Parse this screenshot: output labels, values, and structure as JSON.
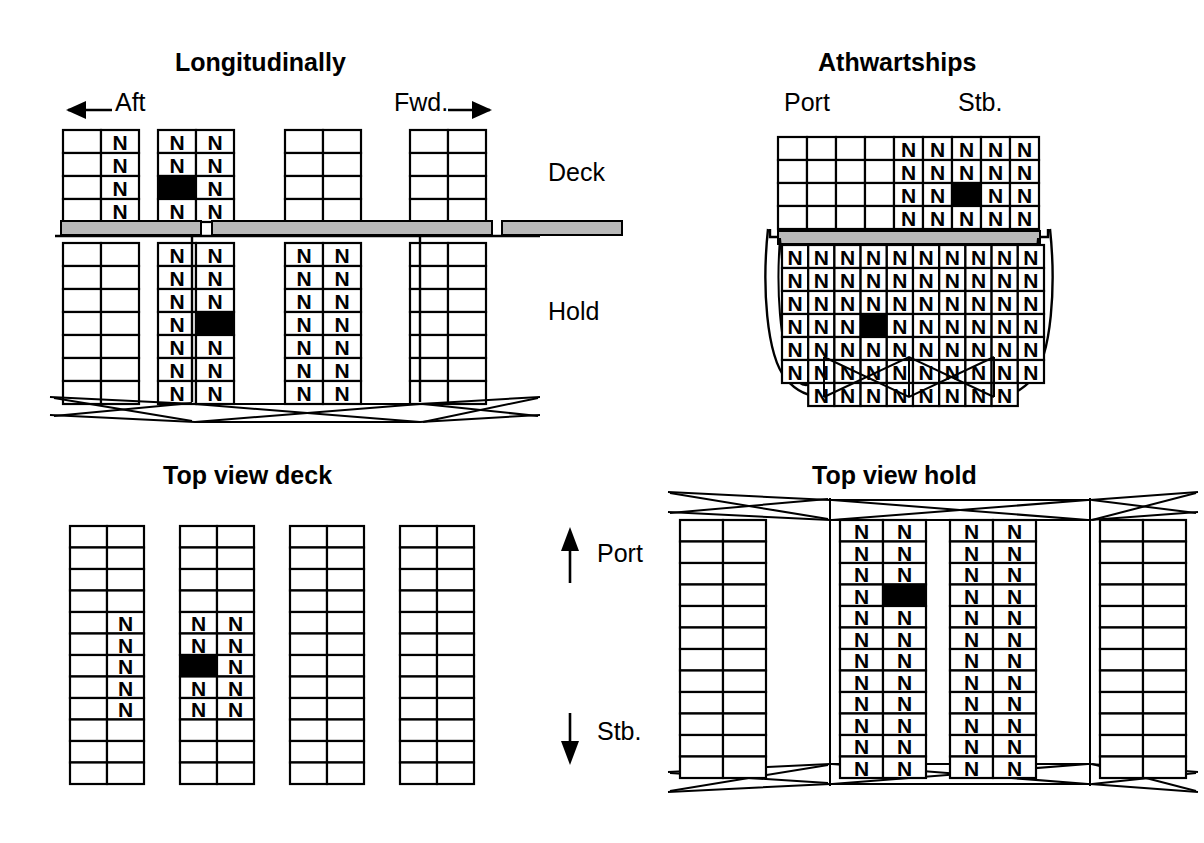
{
  "figure": {
    "container_symbol": "N",
    "colors": {
      "line": "#000000",
      "filled_cell": "#000000",
      "hatch_cover": "#b9b9b9",
      "background": "#ffffff"
    }
  },
  "panels": {
    "longitudinal": {
      "title": "Longitudinally",
      "direction_left_label": "Aft",
      "direction_right_label": "Fwd.",
      "row_label_deck": "Deck",
      "row_label_hold": "Hold",
      "deck": {
        "bays": 4,
        "rows": 4,
        "cols": 2,
        "grid": [
          [
            [
              "",
              "N"
            ],
            [
              "",
              "N"
            ],
            [
              "",
              "N"
            ],
            [
              "",
              "N"
            ]
          ],
          [
            [
              "N",
              "N"
            ],
            [
              "N",
              "N"
            ],
            [
              "X",
              "N"
            ],
            [
              "N",
              "N"
            ]
          ],
          [
            [
              "",
              ""
            ],
            [
              "",
              ""
            ],
            [
              "",
              ""
            ],
            [
              "",
              ""
            ]
          ],
          [
            [
              "",
              ""
            ],
            [
              "",
              ""
            ],
            [
              "",
              ""
            ],
            [
              "",
              ""
            ]
          ]
        ]
      },
      "hold": {
        "bays": 4,
        "rows": 7,
        "cols": 2,
        "grid": [
          [
            [
              "",
              ""
            ],
            [
              "",
              ""
            ],
            [
              "",
              ""
            ],
            [
              "",
              ""
            ],
            [
              "",
              ""
            ],
            [
              "",
              ""
            ],
            [
              "",
              ""
            ]
          ],
          [
            [
              "N",
              "N"
            ],
            [
              "N",
              "N"
            ],
            [
              "N",
              "N"
            ],
            [
              "N",
              "X"
            ],
            [
              "N",
              "N"
            ],
            [
              "N",
              "N"
            ],
            [
              "N",
              "N"
            ]
          ],
          [
            [
              "N",
              "N"
            ],
            [
              "N",
              "N"
            ],
            [
              "N",
              "N"
            ],
            [
              "N",
              "N"
            ],
            [
              "N",
              "N"
            ],
            [
              "N",
              "N"
            ],
            [
              "N",
              "N"
            ]
          ],
          [
            [
              "",
              ""
            ],
            [
              "",
              ""
            ],
            [
              "",
              ""
            ],
            [
              "",
              ""
            ],
            [
              "",
              ""
            ],
            [
              "",
              ""
            ],
            [
              "",
              ""
            ]
          ]
        ]
      }
    },
    "athwartships": {
      "title": "Athwartships",
      "port_label": "Port",
      "stb_label": "Stb.",
      "deck": {
        "rows": 4,
        "cols": 9,
        "grid": [
          [
            "",
            "",
            "",
            "",
            "N",
            "N",
            "N",
            "N",
            "N"
          ],
          [
            "",
            "",
            "",
            "",
            "N",
            "N",
            "N",
            "N",
            "N"
          ],
          [
            "",
            "",
            "",
            "",
            "N",
            "N",
            "X",
            "N",
            "N"
          ],
          [
            "",
            "",
            "",
            "",
            "N",
            "N",
            "N",
            "N",
            "N"
          ]
        ]
      },
      "hold": {
        "rows": 7,
        "cols": 10,
        "grid": [
          [
            "N",
            "N",
            "N",
            "N",
            "N",
            "N",
            "N",
            "N",
            "N",
            "N"
          ],
          [
            "N",
            "N",
            "N",
            "N",
            "N",
            "N",
            "N",
            "N",
            "N",
            "N"
          ],
          [
            "N",
            "N",
            "N",
            "N",
            "N",
            "N",
            "N",
            "N",
            "N",
            "N"
          ],
          [
            "N",
            "N",
            "N",
            "X",
            "N",
            "N",
            "N",
            "N",
            "N",
            "N"
          ],
          [
            "N",
            "N",
            "N",
            "N",
            "N",
            "N",
            "N",
            "N",
            "N",
            "N"
          ],
          [
            "N",
            "N",
            "N",
            "N",
            "N",
            "N",
            "N",
            "N",
            "N",
            "N"
          ],
          [
            "",
            "N",
            "N",
            "N",
            "N",
            "N",
            "N",
            "N",
            "N",
            ""
          ]
        ]
      }
    },
    "top_view_deck": {
      "title": "Top view deck",
      "port_label": "Port",
      "stb_label": "Stb.",
      "bays": 4,
      "rows": 12,
      "cols": 2,
      "grid": [
        [
          [
            "",
            ""
          ],
          [
            "",
            ""
          ],
          [
            "",
            ""
          ],
          [
            "",
            ""
          ],
          [
            "",
            "N"
          ],
          [
            "",
            "N"
          ],
          [
            "",
            "N"
          ],
          [
            "",
            "N"
          ],
          [
            "",
            "N"
          ],
          [
            "",
            ""
          ],
          [
            "",
            ""
          ],
          [
            "",
            ""
          ]
        ],
        [
          [
            "",
            ""
          ],
          [
            "",
            ""
          ],
          [
            "",
            ""
          ],
          [
            "",
            ""
          ],
          [
            "N",
            "N"
          ],
          [
            "N",
            "N"
          ],
          [
            "X",
            "N"
          ],
          [
            "N",
            "N"
          ],
          [
            "N",
            "N"
          ],
          [
            "",
            ""
          ],
          [
            "",
            ""
          ],
          [
            "",
            ""
          ]
        ],
        [
          [
            "",
            ""
          ],
          [
            "",
            ""
          ],
          [
            "",
            ""
          ],
          [
            "",
            ""
          ],
          [
            "",
            ""
          ],
          [
            "",
            ""
          ],
          [
            "",
            ""
          ],
          [
            "",
            ""
          ],
          [
            "",
            ""
          ],
          [
            "",
            ""
          ],
          [
            "",
            ""
          ],
          [
            "",
            ""
          ]
        ],
        [
          [
            "",
            ""
          ],
          [
            "",
            ""
          ],
          [
            "",
            ""
          ],
          [
            "",
            ""
          ],
          [
            "",
            ""
          ],
          [
            "",
            ""
          ],
          [
            "",
            ""
          ],
          [
            "",
            ""
          ],
          [
            "",
            ""
          ],
          [
            "",
            ""
          ],
          [
            "",
            ""
          ],
          [
            "",
            ""
          ]
        ]
      ]
    },
    "top_view_hold": {
      "title": "Top view hold",
      "bays": 4,
      "rows": 12,
      "cols": 2,
      "grid": [
        [
          [
            "",
            ""
          ],
          [
            "",
            ""
          ],
          [
            "",
            ""
          ],
          [
            "",
            ""
          ],
          [
            "",
            ""
          ],
          [
            "",
            ""
          ],
          [
            "",
            ""
          ],
          [
            "",
            ""
          ],
          [
            "",
            ""
          ],
          [
            "",
            ""
          ],
          [
            "",
            ""
          ],
          [
            "",
            ""
          ]
        ],
        [
          [
            "N",
            "N"
          ],
          [
            "N",
            "N"
          ],
          [
            "N",
            "N"
          ],
          [
            "N",
            "X"
          ],
          [
            "N",
            "N"
          ],
          [
            "N",
            "N"
          ],
          [
            "N",
            "N"
          ],
          [
            "N",
            "N"
          ],
          [
            "N",
            "N"
          ],
          [
            "N",
            "N"
          ],
          [
            "N",
            "N"
          ],
          [
            "N",
            "N"
          ]
        ],
        [
          [
            "N",
            "N"
          ],
          [
            "N",
            "N"
          ],
          [
            "N",
            "N"
          ],
          [
            "N",
            "N"
          ],
          [
            "N",
            "N"
          ],
          [
            "N",
            "N"
          ],
          [
            "N",
            "N"
          ],
          [
            "N",
            "N"
          ],
          [
            "N",
            "N"
          ],
          [
            "N",
            "N"
          ],
          [
            "N",
            "N"
          ],
          [
            "N",
            "N"
          ]
        ],
        [
          [
            "",
            ""
          ],
          [
            "",
            ""
          ],
          [
            "",
            ""
          ],
          [
            "",
            ""
          ],
          [
            "",
            ""
          ],
          [
            "",
            ""
          ],
          [
            "",
            ""
          ],
          [
            "",
            ""
          ],
          [
            "",
            ""
          ],
          [
            "",
            ""
          ],
          [
            "",
            ""
          ],
          [
            "",
            ""
          ]
        ]
      ]
    }
  }
}
